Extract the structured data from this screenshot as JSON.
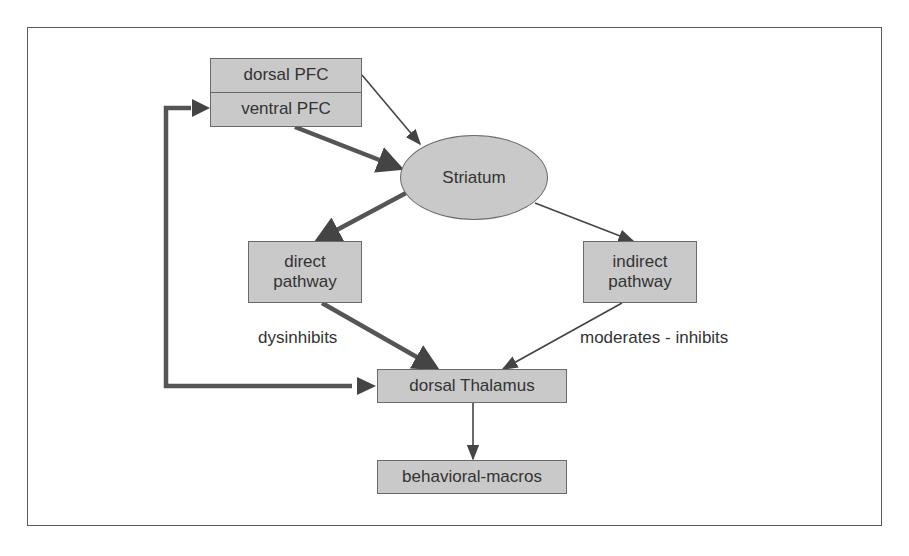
{
  "diagram": {
    "nodes": {
      "dorsal_pfc": {
        "label": "dorsal PFC"
      },
      "ventral_pfc": {
        "label": "ventral PFC"
      },
      "striatum": {
        "label": "Striatum"
      },
      "direct_pathway": {
        "label": "direct\npathway"
      },
      "indirect_pathway": {
        "label": "indirect\npathway"
      },
      "dorsal_thalamus": {
        "label": "dorsal Thalamus"
      },
      "behavioral_macros": {
        "label": "behavioral-macros"
      }
    },
    "edge_labels": {
      "direct_to_thalamus": "dysinhibits",
      "indirect_to_thalamus": "moderates - inhibits"
    },
    "edges": [
      {
        "from": "dorsal PFC",
        "to": "Striatum",
        "weight": "thin"
      },
      {
        "from": "ventral PFC",
        "to": "Striatum",
        "weight": "thick"
      },
      {
        "from": "Striatum",
        "to": "direct pathway",
        "weight": "thick"
      },
      {
        "from": "Striatum",
        "to": "indirect pathway",
        "weight": "thin"
      },
      {
        "from": "direct pathway",
        "to": "dorsal Thalamus",
        "weight": "thick",
        "label": "dysinhibits"
      },
      {
        "from": "indirect pathway",
        "to": "dorsal Thalamus",
        "weight": "thin",
        "label": "moderates - inhibits"
      },
      {
        "from": "dorsal Thalamus",
        "to": "ventral PFC",
        "weight": "thick",
        "routing": "feedback loop (left)"
      },
      {
        "from": "dorsal Thalamus",
        "to": "behavioral-macros",
        "weight": "thin"
      }
    ],
    "colors": {
      "node_fill": "#c9c9c9",
      "node_border": "#6a6a6a",
      "arrow": "#444444",
      "text": "#333333"
    }
  }
}
